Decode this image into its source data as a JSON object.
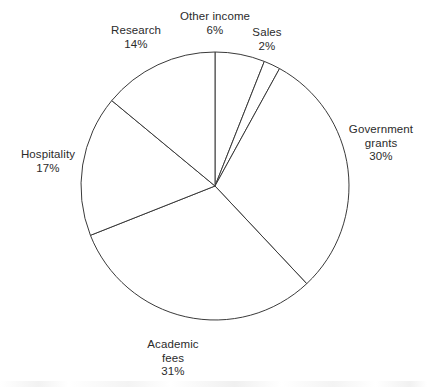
{
  "chart_data": {
    "type": "pie",
    "title": "",
    "subtitle": "",
    "xlabel": "",
    "ylabel": "",
    "legend_position": "none",
    "grid": false,
    "unit": "%",
    "start_angle_deg": 0,
    "direction": "clockwise",
    "categories": [
      "Other income",
      "Sales",
      "Government grants",
      "Academic fees",
      "Hospitality",
      "Research"
    ],
    "values": [
      6,
      2,
      30,
      31,
      17,
      14
    ],
    "slices": [
      {
        "label": "Other income",
        "label_lines": [
          "Other income",
          "6%"
        ],
        "value": 6,
        "percent_text": "6%",
        "color": "#ffffff",
        "stroke": "#3a3a3a"
      },
      {
        "label": "Sales",
        "label_lines": [
          "Sales",
          "2%"
        ],
        "value": 2,
        "percent_text": "2%",
        "color": "#ffffff",
        "stroke": "#3a3a3a"
      },
      {
        "label": "Government grants",
        "label_lines": [
          "Government",
          "grants",
          "30%"
        ],
        "value": 30,
        "percent_text": "30%",
        "color": "#ffffff",
        "stroke": "#3a3a3a"
      },
      {
        "label": "Academic fees",
        "label_lines": [
          "Academic",
          "fees",
          "31%"
        ],
        "value": 31,
        "percent_text": "31%",
        "color": "#ffffff",
        "stroke": "#3a3a3a"
      },
      {
        "label": "Hospitality",
        "label_lines": [
          "Hospitality",
          "17%"
        ],
        "value": 17,
        "percent_text": "17%",
        "color": "#ffffff",
        "stroke": "#3a3a3a"
      },
      {
        "label": "Research",
        "label_lines": [
          "Research",
          "14%"
        ],
        "value": 14,
        "percent_text": "14%",
        "color": "#ffffff",
        "stroke": "#3a3a3a"
      }
    ]
  },
  "labels": {
    "other_income": {
      "line1": "Other income",
      "line2": "6%"
    },
    "sales": {
      "line1": "Sales",
      "line2": "2%"
    },
    "research": {
      "line1": "Research",
      "line2": "14%"
    },
    "government_grants": {
      "line1": "Government",
      "line2": "grants",
      "line3": "30%"
    },
    "hospitality": {
      "line1": "Hospitality",
      "line2": "17%"
    },
    "academic_fees": {
      "line1": "Academic",
      "line2": "fees",
      "line3": "31%"
    }
  },
  "style": {
    "background": "#ffffff",
    "line_color": "#3a3a3a",
    "text_color": "#2b2b2b",
    "slice_fill": "#ffffff"
  },
  "geometry": {
    "center_x": 215,
    "center_y": 186,
    "radius": 134
  }
}
